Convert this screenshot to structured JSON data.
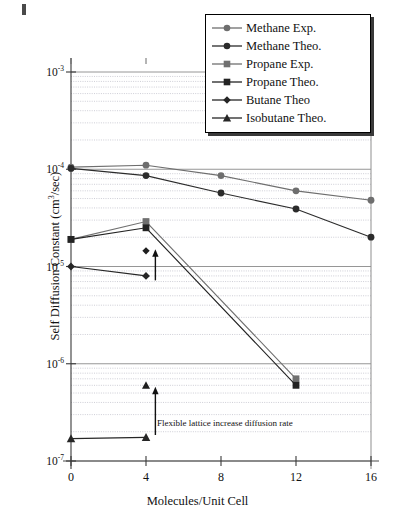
{
  "chart_data": {
    "type": "line",
    "title": "",
    "xlabel": "Molecules/Unit Cell",
    "ylabel": "Self Diffusion Constant (cm3/sec)",
    "ylabel_parts": {
      "pre": "Self Diffusion Constant (cm",
      "sup": "3",
      "post": "/sec)"
    },
    "xlim": [
      0,
      16
    ],
    "ylim": [
      1e-07,
      0.001
    ],
    "yscale": "log",
    "grid": true,
    "grid_minor": true,
    "legend_position": "top-right",
    "xticks": [
      "0",
      "4",
      "8",
      "12",
      "16"
    ],
    "xtick_values": [
      0,
      4,
      8,
      12,
      16
    ],
    "yticks": [
      "10-3",
      "10-4",
      "10-5",
      "10-6",
      "10-7"
    ],
    "ytick_exponents": [
      "-3",
      "-4",
      "-5",
      "-6",
      "-7"
    ],
    "ytick_values": [
      0.001,
      0.0001,
      1e-05,
      1e-06,
      1e-07
    ],
    "ytick_base": "10",
    "series": [
      {
        "name": "Methane Exp.",
        "marker": "circle",
        "color": "#6e6e6e",
        "x": [
          0,
          4,
          8,
          12,
          16
        ],
        "values": [
          0.000105,
          0.00011,
          8.6e-05,
          6e-05,
          4.8e-05
        ]
      },
      {
        "name": "Methane Theo.",
        "marker": "circle",
        "color": "#2b2b2b",
        "x": [
          0,
          4,
          8,
          12,
          16
        ],
        "values": [
          0.000102,
          8.6e-05,
          5.7e-05,
          3.9e-05,
          2e-05
        ]
      },
      {
        "name": "Propane Exp.",
        "marker": "square",
        "color": "#707070",
        "x": [
          0,
          4,
          12
        ],
        "values": [
          1.9e-05,
          2.9e-05,
          7e-07
        ]
      },
      {
        "name": "Propane Theo.",
        "marker": "square",
        "color": "#232323",
        "x": [
          0,
          4,
          12
        ],
        "values": [
          1.9e-05,
          2.5e-05,
          6e-07
        ]
      },
      {
        "name": "Butane Theo",
        "marker": "diamond",
        "color": "#262626",
        "x": [
          0,
          4
        ],
        "values": [
          1e-05,
          8e-06
        ]
      },
      {
        "name": "Isobutane Theo.",
        "marker": "triangle",
        "color": "#262626",
        "x": [
          0,
          4
        ],
        "values": [
          1.7e-07,
          1.75e-07
        ]
      }
    ],
    "isolated_points": [
      {
        "series": "Butane Theo",
        "marker": "diamond",
        "x": 4,
        "value": 1.45e-05
      },
      {
        "series": "Isobutane Theo.",
        "marker": "triangle",
        "x": 4,
        "value": 6e-07
      }
    ],
    "annotations": [
      {
        "text": "Flexible lattice increase diffusion rate",
        "arrow": "up",
        "arrow_x": 4.5,
        "arrow_from": 7.2e-06,
        "arrow_to": 1.35e-05
      },
      {
        "text": "",
        "arrow": "up",
        "arrow_x": 4.5,
        "arrow_from": 1.85e-07,
        "arrow_to": 5.2e-07
      }
    ]
  },
  "legend": {
    "items": [
      {
        "label": "Methane Exp.",
        "marker": "circle",
        "color": "#6e6e6e"
      },
      {
        "label": "Methane Theo.",
        "marker": "circle",
        "color": "#2b2b2b"
      },
      {
        "label": "Propane Exp.",
        "marker": "square",
        "color": "#707070"
      },
      {
        "label": "Propane Theo.",
        "marker": "square",
        "color": "#232323"
      },
      {
        "label": "Butane Theo",
        "marker": "diamond",
        "color": "#262626"
      },
      {
        "label": "Isobutane Theo.",
        "marker": "triangle",
        "color": "#262626"
      }
    ]
  }
}
